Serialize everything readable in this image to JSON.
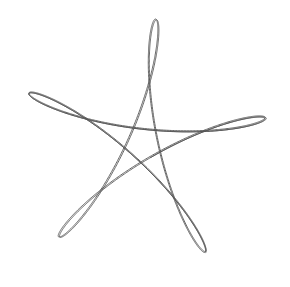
{
  "figure": {
    "background": "#ffffff",
    "stroke_color": "#555555",
    "center": [
      143,
      144
    ],
    "outer_radius_approx": 125,
    "inner_loop_count": 5,
    "params": {
      "a": 70,
      "b": 55,
      "k": -1.5,
      "precession": 0.004,
      "turns": 5,
      "steps": 3000,
      "rotation_deg": 60
    }
  }
}
